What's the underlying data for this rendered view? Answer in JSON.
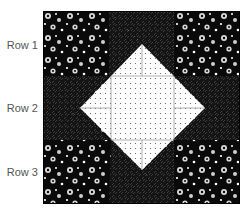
{
  "diagram": {
    "type": "quilt-block",
    "rows": [
      {
        "label": "Row 1"
      },
      {
        "label": "Row 2"
      },
      {
        "label": "Row 3"
      }
    ],
    "colors": {
      "floral_background": "#0a0a0a",
      "flower": "#d9d9d9",
      "star_point_background": "#141414",
      "star_point_texture": "#4a4a4a",
      "center_fabric": "#ffffff",
      "center_dot": "#555555",
      "seam_line": "#9a9a9a",
      "label_text": "#555555"
    }
  }
}
